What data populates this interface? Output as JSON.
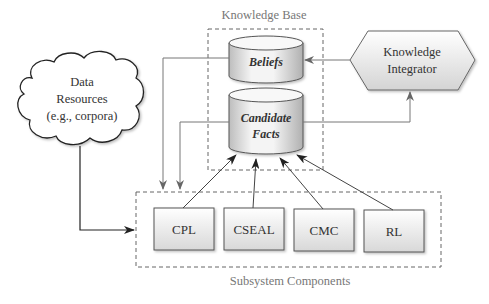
{
  "knowledge_base": {
    "title": "Knowledge Base",
    "stores": [
      {
        "id": "beliefs",
        "label": "Beliefs"
      },
      {
        "id": "candidate_facts",
        "label_line1": "Candidate",
        "label_line2": "Facts"
      }
    ]
  },
  "knowledge_integrator": {
    "line1": "Knowledge",
    "line2": "Integrator"
  },
  "data_resources": {
    "line1": "Data",
    "line2": "Resources",
    "line3": "(e.g., corpora)"
  },
  "subsystem": {
    "title": "Subsystem Components",
    "components": [
      {
        "id": "cpl",
        "label": "CPL"
      },
      {
        "id": "cseal",
        "label": "CSEAL"
      },
      {
        "id": "cmc",
        "label": "CMC"
      },
      {
        "id": "rl",
        "label": "RL"
      }
    ]
  },
  "colors": {
    "line": "#666666",
    "dark_line": "#333333",
    "dash": "#666666",
    "text": "#333333",
    "label_grey": "#777777"
  }
}
